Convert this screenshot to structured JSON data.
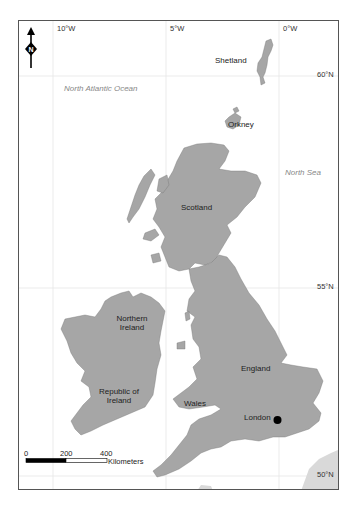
{
  "map": {
    "north_arrow": {
      "icon": "north-arrow-icon",
      "letter": "N"
    },
    "graticule": {
      "longitude_labels": [
        "10°W",
        "5°W",
        "0°W"
      ],
      "latitude_labels": [
        "60°N",
        "55°N",
        "50°N"
      ]
    },
    "seas": {
      "north_atlantic": "North Atlantic Ocean",
      "north_sea": "North Sea"
    },
    "regions": {
      "shetland": "Shetland",
      "orkney": "Orkney",
      "scotland": "Scotland",
      "northern_ireland_line1": "Northern",
      "northern_ireland_line2": "Ireland",
      "republic_line1": "Republic of",
      "republic_line2": "Ireland",
      "england": "England",
      "wales": "Wales"
    },
    "city": {
      "name": "London",
      "marker": "filled-circle"
    },
    "scale_bar": {
      "ticks": [
        "0",
        "200",
        "400"
      ],
      "unit": "Kilometers"
    },
    "colors": {
      "land": "#a6a6a6",
      "continent": "#d9d9d9",
      "frame": "#555555",
      "grid": "#e6e6e6",
      "sea_label": "#888888"
    }
  }
}
